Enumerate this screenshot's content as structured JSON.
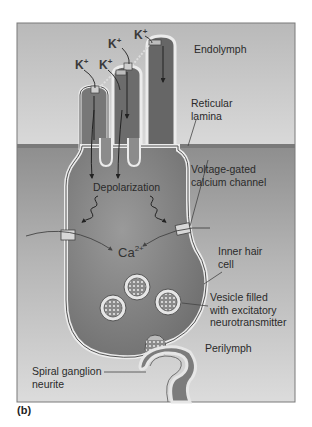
{
  "figure": {
    "panel_label": "(b)",
    "regions": {
      "endolymph": "Endolymph",
      "perilymph": "Perilymph"
    },
    "labels": {
      "reticular_lamina_line1": "Reticular",
      "reticular_lamina_line2": "lamina",
      "depolarization": "Depolarization",
      "voltage_gated_line1": "Voltage-gated",
      "voltage_gated_line2": "calcium channel",
      "inner_hair_cell_line1": "Inner hair",
      "inner_hair_cell_line2": "cell",
      "vesicle_line1": "Vesicle filled",
      "vesicle_line2": "with excitatory",
      "vesicle_line3": "neurotransmitter",
      "spiral_ganglion_line1": "Spiral ganglion",
      "spiral_ganglion_line2": "neurite"
    },
    "ions": {
      "potassium": "K",
      "potassium_charge": "+",
      "calcium": "Ca",
      "calcium_charge": "2+"
    },
    "colors": {
      "endolymph_bg": "#c9c9c9",
      "perilymph_bg_top": "#9a9a9a",
      "perilymph_bg_bottom": "#d8d8d8",
      "cell_fill": "#8a8a8a",
      "membrane_light": "#e8e8e8",
      "membrane_dark": "#555555",
      "frame_border": "#777777"
    }
  }
}
